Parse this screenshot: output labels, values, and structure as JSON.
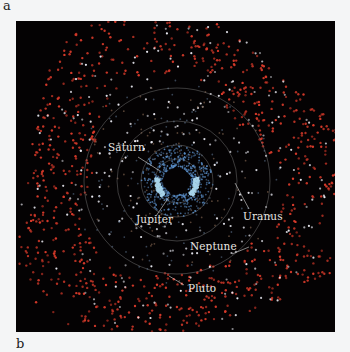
{
  "panel_labels": {
    "top": "a",
    "bottom": "b"
  },
  "figure": {
    "background_color": "#040203",
    "dot_colors": {
      "outer_cloud": "#d83a2a",
      "scattered": "#e8e8f0",
      "inner_swarm": "#5b8fc8"
    },
    "orbit_color": "#8a8a8a",
    "planets": [
      {
        "name": "Saturn",
        "x": 92,
        "y": 127
      },
      {
        "name": "Jupiter",
        "x": 120,
        "y": 199
      },
      {
        "name": "Uranus",
        "x": 227,
        "y": 195
      },
      {
        "name": "Neptune",
        "x": 174,
        "y": 226
      },
      {
        "name": "Pluto",
        "x": 172,
        "y": 268
      }
    ],
    "orbits_radii": [
      22,
      36,
      60,
      93
    ]
  }
}
